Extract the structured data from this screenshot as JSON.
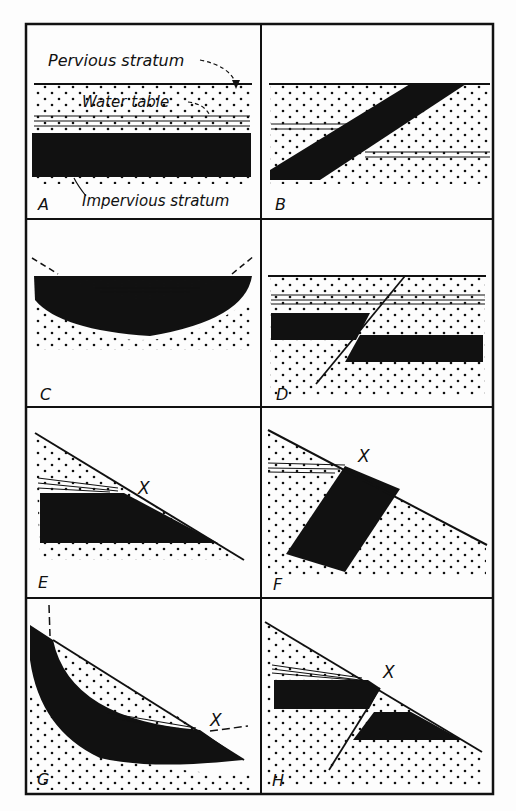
{
  "figure": {
    "panels": [
      {
        "id": "A",
        "label": "A"
      },
      {
        "id": "B",
        "label": "B"
      },
      {
        "id": "C",
        "label": "C"
      },
      {
        "id": "D",
        "label": "D"
      },
      {
        "id": "E",
        "label": "E"
      },
      {
        "id": "F",
        "label": "F"
      },
      {
        "id": "G",
        "label": "G"
      },
      {
        "id": "H",
        "label": "H"
      }
    ],
    "annotations": {
      "pervious": "Pervious stratum",
      "water_table": "Water table",
      "impervious": "Impervious stratum",
      "x_marker": "X"
    },
    "colors": {
      "ink": "#111111",
      "paper": "#fdfdfd"
    }
  }
}
